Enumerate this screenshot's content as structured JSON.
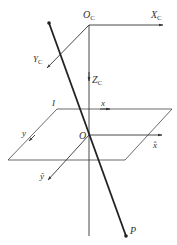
{
  "diagram": {
    "type": "camera-projection-geometry",
    "labels": {
      "camera_origin": "O",
      "camera_origin_sub": "C",
      "camera_x": "X",
      "camera_x_sub": "C",
      "camera_y": "Y",
      "camera_y_sub": "C",
      "camera_z": "Z",
      "camera_z_sub": "C",
      "image_plane": "I",
      "image_x": "x",
      "image_y": "y",
      "normalized_x": "x̂",
      "normalized_y": "ŷ",
      "principal_point": "O",
      "world_point": "P"
    },
    "colors": {
      "line": "#333333",
      "thick_line": "#222222",
      "background": "#ffffff"
    }
  }
}
